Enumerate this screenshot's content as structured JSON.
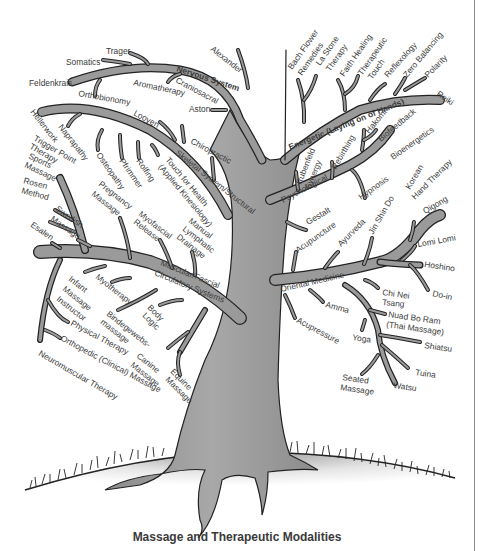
{
  "caption": "Massage and Therapeutic Modalities",
  "colors": {
    "branch_fill": "#9a9a9a",
    "outline": "#2a2a2a",
    "text": "#3a3a3a",
    "background": "#ffffff"
  },
  "categories": {
    "nervous": "Nervous System",
    "energetic": "Energetic (Laying on of Hands)",
    "skeletal": "Skeletal System/Structural",
    "psychological": "Psychological",
    "oriental": "Oriental Medicine",
    "muscular_1": "Muscular/Fascial",
    "muscular_2": "Circulatory Systems"
  },
  "labels": {
    "trager": "Trager",
    "somatics": "Somatics",
    "feldenkrais": "Feldenkrais",
    "orthobionomy": "Orthobionomy",
    "aromatherapy": "Aromatherapy",
    "craniosacral": "Craniosacral",
    "alexander": "Alexander",
    "aston": "Aston",
    "bach_1": "Bach Flower",
    "bach_2": "Remedies",
    "lastone_1": "La Stone",
    "lastone_2": "Therapy",
    "faith_healing": "Faith Healing",
    "therapeutic_1": "Therapeutic",
    "therapeutic_2": "Touch",
    "reflexology": "Reflexology",
    "zero_balancing": "Zero Balancing",
    "polarity": "Polarity",
    "reiki": "Reiki",
    "hellerwork": "Hellerwork",
    "naprapathy": "Naprapathy",
    "looyen": "Looyen",
    "chiropractic": "Chiropractic",
    "osteopathy": "Osteopathy",
    "pfrimmer": "Pfrimmer",
    "rolfing": "Rolfing",
    "touch_health_1": "Touch for Health",
    "touch_health_2": "(Applied Kinesiology)",
    "trigger_1": "Trigger Point",
    "trigger_2": "Therapy",
    "sports_1": "Sports",
    "sports_2": "Massage",
    "rosen_1": "Rosen",
    "rosen_2": "Method",
    "swedish_1": "Swedish",
    "swedish_2": "Massage",
    "esalen": "Esalen",
    "pregnancy_1": "Pregnancy",
    "pregnancy_2": "Massage",
    "myofascial_1": "Myofascial",
    "myofascial_2": "Release",
    "mld_1": "Manual",
    "mld_2": "Lymphatic",
    "mld_3": "Drainage",
    "rubenfeld_1": "Rubenfeld",
    "rubenfeld_2": "Synergy",
    "rebirthing": "Rebirthing",
    "hakomi": "Hakomi",
    "biofeedback": "Biofeedback",
    "bioenergetics": "Bioenergetics",
    "hypnosis": "Hypnosis",
    "gestalt": "Gestalt",
    "acupuncture": "Acupuncture",
    "ayurveda": "Ayurveda",
    "jin_shin_do": "Jin Shin Do",
    "korean_1": "Korean",
    "korean_2": "Hand Therapy",
    "qigong": "Qigong",
    "lomi": "Lomi Lomi",
    "hoshino": "Hoshino",
    "doin": "Do-in",
    "chinei_1": "Chi Nei",
    "chinei_2": "Tsang",
    "amma": "Amma",
    "nuad_1": "Nuad Bo Ram",
    "nuad_2": "(Thai Massage)",
    "shiatsu": "Shiatsu",
    "tuina": "Tuina",
    "yoga": "Yoga",
    "acupressure": "Acupressure",
    "seated_1": "Seated",
    "seated_2": "Massage",
    "watsu": "Watsu",
    "infant_1": "Infant",
    "infant_2": "Massage",
    "infant_3": "Instructor",
    "myotherapy": "Myotherapy",
    "body_1": "Body",
    "body_2": "Logic",
    "bindege_1": "Bindegewebs-",
    "bindege_2": "massage",
    "physical_therapy": "Physical Therapy",
    "orthopedic": "Orthopedic (Clinical) Massage",
    "neuromuscular": "Neuromuscular Therapy",
    "canine_1": "Canine",
    "canine_2": "Massage",
    "equine_1": "Equine",
    "equine_2": "Massage"
  }
}
